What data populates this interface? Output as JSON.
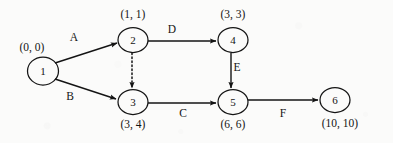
{
  "diagram": {
    "type": "activity-network-diagram",
    "background_color": "#fbfbfa",
    "stroke_color": "#141414",
    "nodes": [
      {
        "id": "1",
        "label": "1",
        "time_label": "(0, 0)",
        "time_position": "above-left",
        "cx": 43,
        "cy": 71,
        "rx": 15,
        "ry": 14,
        "label_x": 32,
        "label_y": 48
      },
      {
        "id": "2",
        "label": "2",
        "time_label": "(1, 1)",
        "time_position": "above",
        "cx": 133,
        "cy": 40,
        "rx": 15,
        "ry": 12.5,
        "label_x": 133,
        "label_y": 15
      },
      {
        "id": "3",
        "label": "3",
        "time_label": "(3, 4)",
        "time_position": "below",
        "cx": 133,
        "cy": 102,
        "rx": 15,
        "ry": 12.5,
        "label_x": 133,
        "label_y": 125
      },
      {
        "id": "4",
        "label": "4",
        "time_label": "(3, 3)",
        "time_position": "above",
        "cx": 233,
        "cy": 40,
        "rx": 15,
        "ry": 12.5,
        "label_x": 233,
        "label_y": 15
      },
      {
        "id": "5",
        "label": "5",
        "time_label": "(6, 6)",
        "time_position": "below",
        "cx": 233,
        "cy": 102,
        "rx": 15,
        "ry": 12.5,
        "label_x": 233,
        "label_y": 125
      },
      {
        "id": "6",
        "label": "6",
        "time_label": "(10, 10)",
        "time_position": "below",
        "cx": 335,
        "cy": 100,
        "rx": 15,
        "ry": 12.5,
        "label_x": 340,
        "label_y": 124
      }
    ],
    "edges": [
      {
        "id": "A",
        "label": "A",
        "from": "1",
        "to": "2",
        "style": "solid",
        "label_x": 74,
        "label_y": 38
      },
      {
        "id": "B",
        "label": "B",
        "from": "1",
        "to": "3",
        "style": "solid",
        "label_x": 70,
        "label_y": 97
      },
      {
        "id": "dummy",
        "label": "",
        "from": "2",
        "to": "3",
        "style": "dotted",
        "label_x": 0,
        "label_y": 0
      },
      {
        "id": "D",
        "label": "D",
        "from": "2",
        "to": "4",
        "style": "solid",
        "label_x": 172,
        "label_y": 30
      },
      {
        "id": "E",
        "label": "E",
        "from": "4",
        "to": "5",
        "style": "solid",
        "label_x": 237,
        "label_y": 68
      },
      {
        "id": "C",
        "label": "C",
        "from": "3",
        "to": "5",
        "style": "solid",
        "label_x": 183,
        "label_y": 114
      },
      {
        "id": "F",
        "label": "F",
        "from": "5",
        "to": "6",
        "style": "solid",
        "label_x": 283,
        "label_y": 114
      }
    ]
  }
}
